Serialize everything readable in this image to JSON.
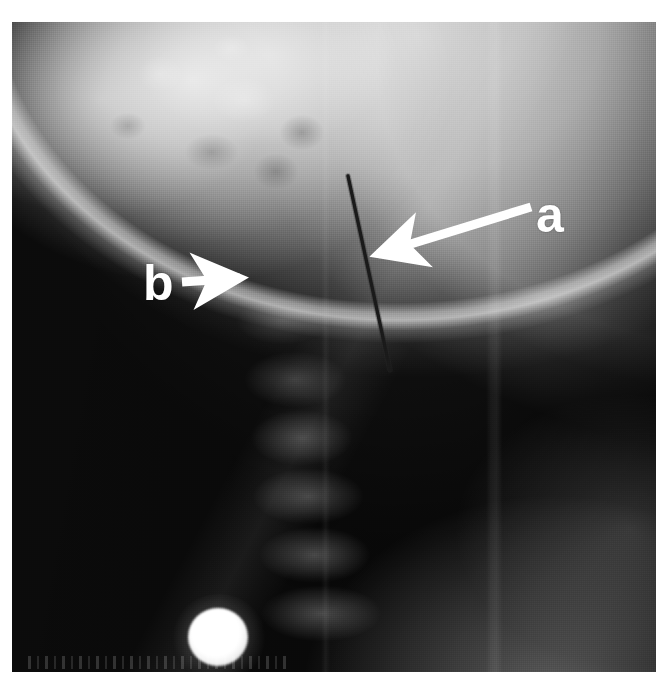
{
  "figure": {
    "kind": "radiograph",
    "modality": "plain-film-xray",
    "view": "lateral cervical spine",
    "caption": "",
    "canvas": {
      "width": 668,
      "height": 685,
      "background": "#ffffff"
    },
    "plate": {
      "left": 12,
      "top": 22,
      "width": 644,
      "height": 650
    }
  },
  "annotations": [
    {
      "id": "a",
      "label": "a",
      "color": "#ffffff",
      "font_size_px": 50,
      "label_position": {
        "x": 536,
        "y": 190
      },
      "arrow": {
        "style": "solid-filled",
        "color": "#ffffff",
        "tail": {
          "x": 530,
          "y": 206
        },
        "tip": {
          "x": 372,
          "y": 256
        },
        "direction": "down-left",
        "points_to": "radiopaque needle / electrode shaft"
      }
    },
    {
      "id": "b",
      "label": "b",
      "color": "#ffffff",
      "font_size_px": 50,
      "label_position": {
        "x": 143,
        "y": 258
      },
      "arrow": {
        "style": "solid-filled",
        "color": "#ffffff",
        "tail": {
          "x": 184,
          "y": 280
        },
        "tip": {
          "x": 252,
          "y": 276
        },
        "direction": "right",
        "points_to": "posterior soft-tissue / vertebral level"
      }
    }
  ],
  "features": [
    {
      "name": "needle",
      "description": "thin radiopaque needle / electrode",
      "color": "#151515",
      "from": {
        "x": 348,
        "y": 166
      },
      "to": {
        "x": 390,
        "y": 360
      },
      "thickness_px": 3
    },
    {
      "name": "fiducial-marker",
      "description": "bright radiopaque spherical marker",
      "color": "#ffffff",
      "center": {
        "x": 206,
        "y": 615
      },
      "radius_px": 30
    },
    {
      "name": "mandible",
      "description": "bright mandibular body and inferior border arc",
      "region": "upper-right"
    },
    {
      "name": "skull-base",
      "description": "mottled bright skull base / mastoid",
      "region": "upper-left"
    },
    {
      "name": "cervical-vertebrae",
      "description": "cervical vertebral bodies column",
      "region": "center"
    },
    {
      "name": "air-column",
      "description": "dark air / background region",
      "region": "right"
    },
    {
      "name": "collimation-band",
      "description": "faint vertical collimation edge",
      "region": "right-of-center"
    }
  ],
  "film_legend": {
    "text": "",
    "note": "illegible exposure strip along bottom edge"
  },
  "colors": {
    "annotation": "#ffffff",
    "needle": "#151515",
    "page_background": "#ffffff",
    "film_midtone": "#7a7a7a",
    "film_shadow": "#181818",
    "film_highlight": "#ffffff"
  }
}
